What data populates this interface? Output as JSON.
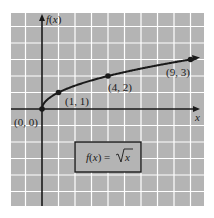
{
  "chart_data": {
    "type": "line",
    "title": "",
    "function_label": "f(x) = √x",
    "xlabel": "x",
    "ylabel": "f(x)",
    "xlim": [
      -2,
      10
    ],
    "ylim": [
      -6,
      6
    ],
    "grid": true,
    "grid_step": 1,
    "legend_position": "none",
    "series": [
      {
        "name": "f(x) = √x",
        "x": [
          0,
          1,
          4,
          9
        ],
        "y": [
          0,
          1,
          2,
          3
        ]
      }
    ],
    "annotations": [
      {
        "text": "(0, 0)",
        "x": 0,
        "y": 0
      },
      {
        "text": "(1, 1)",
        "x": 1,
        "y": 1
      },
      {
        "text": "(4, 2)",
        "x": 4,
        "y": 2
      },
      {
        "text": "(9, 3)",
        "x": 9,
        "y": 3
      }
    ]
  },
  "labels": {
    "y_axis": "f(x)",
    "x_axis": "x",
    "p0": "(0, 0)",
    "p1": "(1, 1)",
    "p4": "(4, 2)",
    "p9": "(9, 3)",
    "formula_lhs": "f(x) = ",
    "formula_rad": "x"
  },
  "colors": {
    "background": "#b4b4b4",
    "grid": "#ffffff",
    "axis": "#1a1a1a",
    "curve": "#1a1a1a"
  }
}
